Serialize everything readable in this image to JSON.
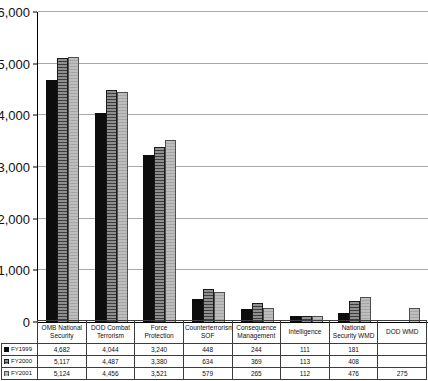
{
  "chart_data": {
    "type": "bar",
    "title": "",
    "xlabel": "",
    "ylabel": "",
    "categories": [
      "OMB National Security",
      "DOD Combat Terrorism",
      "Force Protection",
      "Counterterrorism/ SOF",
      "Consequence Management",
      "Intelligence",
      "National Security WMD",
      "DOD WMD"
    ],
    "series": [
      {
        "name": "FY1999",
        "values": [
          4682,
          4044,
          3240,
          448,
          244,
          111,
          181,
          null
        ]
      },
      {
        "name": "FY2000",
        "values": [
          5117,
          4487,
          3380,
          634,
          369,
          113,
          408,
          null
        ]
      },
      {
        "name": "FY2001",
        "values": [
          5124,
          4456,
          3521,
          579,
          265,
          112,
          476,
          275
        ]
      }
    ],
    "ylim": [
      0,
      6000
    ],
    "grid": true,
    "legend_position": "table-left",
    "yticks": [
      {
        "value": 0,
        "label": "0"
      },
      {
        "value": 1000,
        "label": "1,000"
      },
      {
        "value": 2000,
        "label": "2,000"
      },
      {
        "value": 3000,
        "label": "3,000"
      },
      {
        "value": 4000,
        "label": "4,000"
      },
      {
        "value": 5000,
        "label": "5,000"
      },
      {
        "value": 6000,
        "label": "6,000"
      }
    ]
  },
  "table": {
    "display_rows": [
      {
        "legend": "FY1999",
        "cells": [
          "4,682",
          "4,044",
          "3,240",
          "448",
          "244",
          "111",
          "181",
          ""
        ]
      },
      {
        "legend": "FY2000",
        "cells": [
          "5,117",
          "4,487",
          "3,380",
          "634",
          "369",
          "113",
          "408",
          ""
        ]
      },
      {
        "legend": "FY2001",
        "cells": [
          "5,124",
          "4,456",
          "3,521",
          "579",
          "265",
          "112",
          "476",
          "275"
        ]
      }
    ]
  },
  "colors": {
    "fy1999": "#0d0d0d",
    "fy2000_base": "#8f8f8f",
    "fy2000_stripe": "#3d3d3d",
    "fy2001_base": "#bdbdbd",
    "fy2001_stripe": "#a6a6a6",
    "gridline": "#a9a9a9",
    "axis": "#000000"
  }
}
